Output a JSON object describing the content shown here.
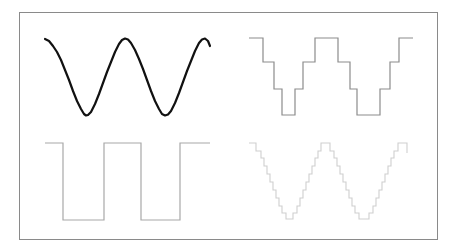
{
  "figure": {
    "colors": {
      "border": "#8a8a8a",
      "sine": "#111111",
      "staircase_coarse": "#8c8c8c",
      "square": "#a8a8a8",
      "staircase_fine": "#cfcfcf"
    }
  },
  "panels": [
    {
      "name": "sine-wave",
      "stroke": "#111111",
      "width": 2.2,
      "points": "45,39 49,41 53,46 57,52 61,60 65,70 69,80 73,91 77,101 81,109 84,114 86,115.5 88,115 91,112 95,104 99,94 103,83 107,72 111,62 115,52 119,44 122,40 125,38.5 128,39.5 131,43 135,50 139,59 143,69 147,80 151,91 155,101 159,109 162,114 165,115.5 168,114.5 171,111 175,103 179,93 183,82 187,71 191,61 195,51 199,43 202,39.5 205,38.5 208,41 210,46"
    },
    {
      "name": "quantized-sine-4-level",
      "stroke": "#8c8c8c",
      "width": 1.2,
      "points": "249,38 263,38 263,62 274,62 274,89 282,89 282,115 295,115 295,89 303,89 303,62 315,62 315,38 338,38 338,62 350,62 350,89 357,89 357,115 380,115 380,89 390,89 390,62 399,62 399,38 413,38"
    },
    {
      "name": "square-wave",
      "stroke": "#a8a8a8",
      "width": 1.2,
      "points": "45,143 63,143 63,220 104,220 104,143 141,143 141,220 180,220 180,143 210,143"
    },
    {
      "name": "quantized-sine-fine",
      "stroke": "#cfcfcf",
      "width": 1.1,
      "points": "249,143 256,143 256,151 261,151 261,158 264,158 264,166 267,166 267,174 270,174 270,182 273,182 273,190 276,190 276,198 279,198 279,206 282,206 282,213 286,213 286,219 293,219 293,213 297,213 297,206 300,206 300,198 303,198 303,190 306,190 306,182 309,182 309,174 312,174 312,166 315,166 315,158 318,158 318,151 321,151 321,143 330,143 330,151 334,151 334,158 337,158 337,166 340,166 340,174 343,174 343,182 346,182 346,190 349,190 349,198 352,198 352,206 355,206 355,213 359,213 359,219 369,219 369,213 373,213 373,206 376,206 376,198 379,198 379,190 382,190 382,182 385,182 385,174 388,174 388,166 391,166 391,158 394,158 394,151 398,151 398,143 407,143 407,153"
    }
  ]
}
